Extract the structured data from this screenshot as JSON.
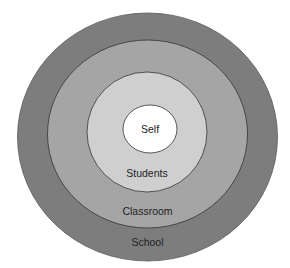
{
  "diagram": {
    "type": "concentric-circles",
    "rings": [
      {
        "id": "school",
        "label": "School",
        "fill": "#7d7d7d",
        "stroke": "#5a5a5a",
        "cx": 147.5,
        "cy": 137,
        "rx": 130,
        "ry": 124,
        "label_y": 246
      },
      {
        "id": "classroom",
        "label": "Classroom",
        "fill": "#a5a5a5",
        "stroke": "#333333",
        "cx": 147.5,
        "cy": 134,
        "rx": 100,
        "ry": 94,
        "label_y": 215
      },
      {
        "id": "students",
        "label": "Students",
        "fill": "#cfcfcf",
        "stroke": "#333333",
        "cx": 147,
        "cy": 132,
        "rx": 60,
        "ry": 60,
        "label_y": 177
      },
      {
        "id": "self",
        "label": "Self",
        "fill": "#ffffff",
        "stroke": "#333333",
        "cx": 150,
        "cy": 129,
        "rx": 27,
        "ry": 24,
        "label_y": 133
      }
    ]
  }
}
